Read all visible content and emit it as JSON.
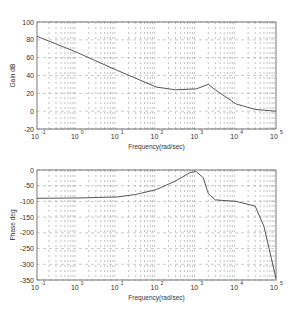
{
  "chart_data": [
    {
      "type": "line",
      "title": "",
      "xlabel": "Frequency(rad/sec)",
      "ylabel": "Gain dB",
      "xscale": "log",
      "xlim": [
        0.1,
        100000
      ],
      "ylim": [
        -20,
        100
      ],
      "grid": true,
      "x_tick_labels": [
        "10^-1",
        "10^0",
        "10^1",
        "10^2",
        "10^3",
        "10^4",
        "10^5"
      ],
      "y_tick_labels": [
        "100",
        "80",
        "60",
        "40",
        "20",
        "0",
        "-20"
      ],
      "series": [
        {
          "name": "Gain",
          "x": [
            0.1,
            1,
            10,
            100,
            300,
            1000,
            2000,
            3000,
            10000,
            30000,
            100000
          ],
          "values": [
            84,
            66,
            46,
            27,
            24,
            25,
            30,
            24,
            8,
            2,
            0
          ]
        }
      ]
    },
    {
      "type": "line",
      "title": "",
      "xlabel": "Frequency(rad/sec)",
      "ylabel": "Phase deg",
      "xscale": "log",
      "xlim": [
        0.1,
        100000
      ],
      "ylim": [
        -350,
        0
      ],
      "grid": true,
      "x_tick_labels": [
        "10^-1",
        "10^0",
        "10^1",
        "10^2",
        "10^3",
        "10^4",
        "10^5"
      ],
      "y_tick_labels": [
        "0",
        "-50",
        "-100",
        "-150",
        "-200",
        "-250",
        "-300",
        "-350"
      ],
      "series": [
        {
          "name": "Phase",
          "x": [
            0.1,
            1,
            10,
            30,
            100,
            300,
            700,
            1000,
            1500,
            2000,
            3000,
            10000,
            30000,
            50000,
            100000
          ],
          "values": [
            -90,
            -89,
            -86,
            -78,
            -62,
            -35,
            -8,
            -5,
            -25,
            -75,
            -95,
            -100,
            -115,
            -180,
            -345
          ]
        }
      ]
    }
  ],
  "plots": {
    "gain": {
      "ylabel": "Gain dB",
      "xlabel": "Frequency(rad/sec)"
    },
    "phase": {
      "ylabel": "Phase deg",
      "xlabel": "Frequency(rad/sec)"
    }
  }
}
